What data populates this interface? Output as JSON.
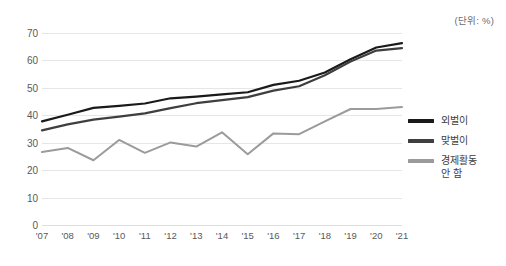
{
  "unit_note": "(단위: %)",
  "legend": {
    "items": [
      {
        "label": "외벌이",
        "color": "#1a1a1a"
      },
      {
        "label": "맞벌이",
        "color": "#3f3f3f"
      },
      {
        "label": "경제활동\n안 함",
        "color": "#9b9b9b"
      }
    ]
  },
  "chart_data": {
    "type": "line",
    "title": "",
    "subtitle": "",
    "xlabel": "",
    "ylabel": "",
    "unit": "(단위: %)",
    "categories": [
      "'07",
      "'08",
      "'09",
      "'10",
      "'11",
      "'12",
      "'13",
      "'14",
      "'15",
      "'16",
      "'17",
      "'18",
      "'19",
      "'20",
      "'21"
    ],
    "ylim": [
      0,
      70
    ],
    "yticks": [
      0,
      10,
      20,
      30,
      40,
      50,
      60,
      70
    ],
    "grid": true,
    "legend_position": "right",
    "series": [
      {
        "name": "외벌이",
        "color": "#1a1a1a",
        "values": [
          37.8,
          40.2,
          42.7,
          43.4,
          44.3,
          46.2,
          46.8,
          47.6,
          48.4,
          51.1,
          52.6,
          55.6,
          60.4,
          64.7,
          66.3
        ]
      },
      {
        "name": "맞벌이",
        "color": "#3f3f3f",
        "values": [
          34.5,
          36.7,
          38.4,
          39.5,
          40.7,
          42.6,
          44.4,
          45.5,
          46.6,
          49.0,
          50.6,
          54.6,
          59.6,
          63.6,
          64.5
        ]
      },
      {
        "name": "경제활동 안 함",
        "color": "#9b9b9b",
        "values": [
          26.6,
          28.1,
          23.6,
          31.0,
          26.3,
          30.1,
          28.6,
          33.8,
          25.8,
          33.4,
          33.1,
          37.8,
          42.3,
          42.3,
          43.0
        ]
      }
    ]
  }
}
